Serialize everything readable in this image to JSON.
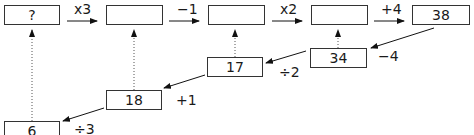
{
  "diagram": {
    "top_row": [
      {
        "value": "?"
      },
      {
        "value": ""
      },
      {
        "value": ""
      },
      {
        "value": ""
      },
      {
        "value": "38"
      }
    ],
    "forward_ops": [
      "x3",
      "−1",
      "x2",
      "+4"
    ],
    "reverse_chain": [
      {
        "value": "34",
        "op": "−4"
      },
      {
        "value": "17",
        "op": "÷2"
      },
      {
        "value": "18",
        "op": "+1"
      },
      {
        "value": "6",
        "op": "÷3"
      }
    ]
  }
}
